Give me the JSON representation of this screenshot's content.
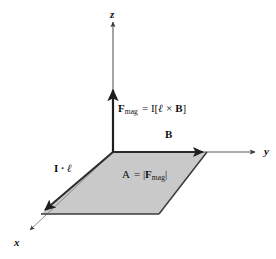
{
  "figure": {
    "type": "vector-diagram"
  },
  "colors": {
    "background": "#ffffff",
    "parallelogram_fill": "#c9c9c9",
    "parallelogram_stroke": "#3a3a3a",
    "axis_stroke": "#555555",
    "vector_stroke": "#2b2b2b",
    "text": "#111111"
  },
  "axes": [
    {
      "id": "z",
      "label": "z",
      "direction": "up",
      "tip": [
        113,
        18
      ],
      "origin": [
        113,
        152
      ]
    },
    {
      "id": "y",
      "label": "y",
      "direction": "right",
      "tip": [
        258,
        152
      ],
      "origin": [
        113,
        152
      ]
    },
    {
      "id": "x",
      "label": "x",
      "direction": "down-left",
      "tip": [
        26,
        233
      ],
      "origin": [
        113,
        152
      ]
    }
  ],
  "vectors": [
    {
      "id": "f-mag",
      "label_plain": "F_mag = I[l x B]",
      "label_parts": {
        "f": "F",
        "sub": "mag",
        "rest": " = I[",
        "l": "ℓ",
        "cross": " × ",
        "b": "B",
        "close": "]"
      },
      "from": [
        113,
        152
      ],
      "to": [
        113,
        86
      ],
      "along_axis": "z"
    },
    {
      "id": "b-field",
      "label": "B",
      "from": [
        113,
        152
      ],
      "to": [
        207,
        152
      ],
      "along_axis": "y"
    },
    {
      "id": "current-length",
      "label_parts": {
        "i": "I",
        "dot": " · ",
        "l": "ℓ"
      },
      "label_plain": "I · ℓ",
      "from": [
        113,
        152
      ],
      "to": [
        41,
        214
      ],
      "along_axis": "x"
    }
  ],
  "area_region": {
    "id": "parallelogram",
    "label_parts": {
      "a": "A",
      "eq": " = |",
      "f": "F",
      "sub": "mag",
      "close": "|"
    },
    "label_plain": "A = |F_mag|",
    "vertices": [
      [
        113,
        152
      ],
      [
        207,
        152
      ],
      [
        159,
        214
      ],
      [
        41,
        214
      ]
    ],
    "fill": "#c9c9c9"
  },
  "labels": {
    "z_axis": "z",
    "y_axis": "y",
    "x_axis": "x",
    "b_field": "B",
    "current_length_i": "I",
    "current_length_dot": "·",
    "current_length_l": "ℓ",
    "fmag_f": "F",
    "fmag_sub": "mag",
    "fmag_eq_open": "= I[",
    "fmag_l": "ℓ",
    "fmag_cross": "×",
    "fmag_b": "B",
    "fmag_close": "]",
    "area_a": "A",
    "area_eq_open": "= |",
    "area_f": "F",
    "area_sub": "mag",
    "area_close": "|"
  }
}
